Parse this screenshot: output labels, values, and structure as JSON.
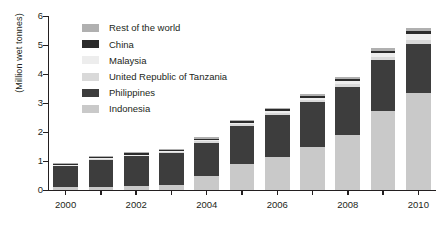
{
  "chart_data": {
    "type": "bar",
    "stacked": true,
    "title": "",
    "xlabel": "",
    "ylabel": "(Million wet tonnes)",
    "ylim": [
      0,
      6
    ],
    "yticks": [
      0,
      1,
      2,
      3,
      4,
      5,
      6
    ],
    "ytick_labels": [
      "0",
      "1",
      "2",
      "3",
      "4",
      "5",
      "6"
    ],
    "grid": false,
    "legend_position": "top-left-inside",
    "categories": [
      "2000",
      "2001",
      "2002",
      "2003",
      "2004",
      "2005",
      "2006",
      "2007",
      "2008",
      "2009",
      "2010"
    ],
    "xtick_labels_shown": [
      "2000",
      "2002",
      "2004",
      "2006",
      "2008",
      "2010"
    ],
    "series": [
      {
        "name": "Indonesia",
        "color": "#c9c9c9",
        "values": [
          0.09,
          0.12,
          0.14,
          0.18,
          0.47,
          0.91,
          1.13,
          1.47,
          1.91,
          2.72,
          3.35
        ]
      },
      {
        "name": "Philippines",
        "color": "#3d3d3d",
        "values": [
          0.74,
          0.93,
          1.04,
          1.09,
          1.15,
          1.29,
          1.45,
          1.55,
          1.65,
          1.75,
          1.7
        ]
      },
      {
        "name": "United Republic of Tanzania",
        "color": "#d9d9d9",
        "values": [
          0.02,
          0.03,
          0.03,
          0.04,
          0.06,
          0.07,
          0.08,
          0.09,
          0.1,
          0.12,
          0.13
        ]
      },
      {
        "name": "Malaysia",
        "color": "#ededed",
        "values": [
          0.01,
          0.01,
          0.01,
          0.02,
          0.03,
          0.04,
          0.05,
          0.07,
          0.1,
          0.14,
          0.21
        ]
      },
      {
        "name": "China",
        "color": "#2b2b2b",
        "values": [
          0.05,
          0.05,
          0.05,
          0.05,
          0.06,
          0.06,
          0.07,
          0.07,
          0.08,
          0.08,
          0.09
        ]
      },
      {
        "name": "Rest of the world",
        "color": "#b0b0b0",
        "values": [
          0.03,
          0.03,
          0.03,
          0.04,
          0.05,
          0.05,
          0.06,
          0.06,
          0.07,
          0.08,
          0.09
        ]
      }
    ],
    "totals": [
      0.94,
      1.17,
      1.3,
      1.42,
      1.82,
      2.42,
      2.84,
      3.31,
      3.91,
      4.89,
      5.57
    ]
  },
  "legend": {
    "items": [
      {
        "label": "Rest of the world",
        "color": "#b0b0b0"
      },
      {
        "label": "China",
        "color": "#2b2b2b"
      },
      {
        "label": "Malaysia",
        "color": "#ededed"
      },
      {
        "label": "United Republic of Tanzania",
        "color": "#d9d9d9"
      },
      {
        "label": "Philippines",
        "color": "#3d3d3d"
      },
      {
        "label": "Indonesia",
        "color": "#c9c9c9"
      }
    ]
  },
  "axis": {
    "y_label": "(Million wet tonnes)"
  },
  "colors": {
    "axis": "#231f20",
    "text": "#231f20",
    "background": "#ffffff"
  }
}
